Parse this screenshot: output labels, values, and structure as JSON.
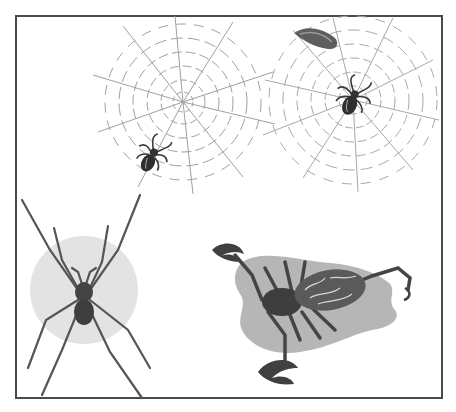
{
  "illustration": {
    "subject": "Arachnids: spiders, webs and a scorpion",
    "background": "#ffffff",
    "frame": {
      "left": 15,
      "top": 15,
      "right": 441,
      "bottom": 397,
      "color": "#4a4a4a"
    },
    "elements": [
      {
        "name": "spider-web-left",
        "center": [
          183,
          102
        ],
        "color": "#9a9a9a"
      },
      {
        "name": "spider-web-right",
        "center": [
          355,
          103
        ],
        "color": "#9a9a9a"
      },
      {
        "name": "spider-small-left",
        "center": [
          152,
          157
        ],
        "color": "#3a3a3a"
      },
      {
        "name": "spider-small-right",
        "center": [
          353,
          97
        ],
        "color": "#3a3a3a"
      },
      {
        "name": "leaf-object",
        "center": [
          313,
          40
        ],
        "color": "#5a5a5a"
      },
      {
        "name": "wolf-spider",
        "center": [
          84,
          306
        ],
        "backdrop_color": "#e2e2e2",
        "color": "#505050"
      },
      {
        "name": "scorpion",
        "center": [
          310,
          305
        ],
        "backdrop_color": "#b8b8b8",
        "color": "#4a4a4a"
      }
    ]
  }
}
